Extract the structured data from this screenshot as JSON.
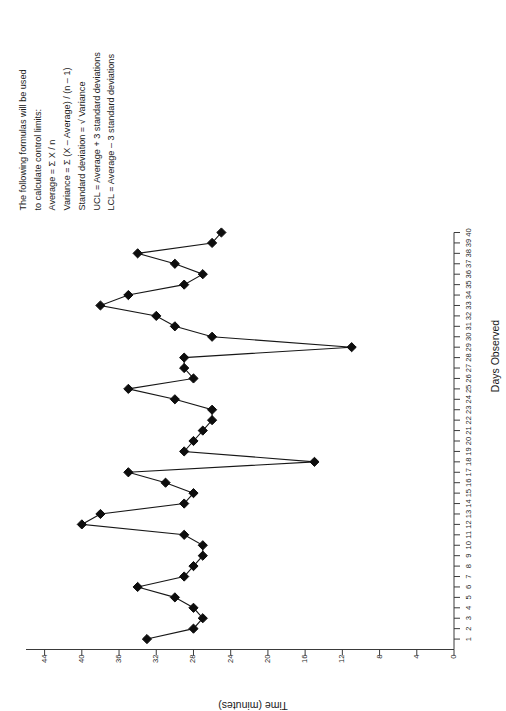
{
  "chart_data": {
    "type": "line",
    "title": "",
    "xlabel": "Days Observed",
    "ylabel": "Time (minutes)",
    "xlim": [
      0,
      40
    ],
    "ylim": [
      0,
      46
    ],
    "grid": false,
    "legend_position": "none",
    "marker": "diamond",
    "x_ticks": [
      1,
      2,
      3,
      4,
      5,
      6,
      7,
      8,
      9,
      10,
      11,
      12,
      13,
      14,
      15,
      16,
      17,
      18,
      19,
      20,
      21,
      22,
      23,
      24,
      25,
      26,
      27,
      28,
      29,
      30,
      31,
      32,
      33,
      34,
      35,
      36,
      37,
      38,
      39,
      40
    ],
    "y_ticks": [
      0,
      4,
      8,
      12,
      16,
      20,
      24,
      28,
      32,
      36,
      40,
      44
    ],
    "x": [
      1,
      2,
      3,
      4,
      5,
      6,
      7,
      8,
      9,
      10,
      11,
      12,
      13,
      14,
      15,
      16,
      17,
      18,
      19,
      20,
      21,
      22,
      23,
      24,
      25,
      26,
      27,
      28,
      29,
      30,
      31,
      32,
      33,
      34,
      35,
      36,
      37,
      38,
      39,
      40
    ],
    "values": [
      33,
      28,
      27,
      28,
      30,
      34,
      29,
      28,
      27,
      27,
      29,
      40,
      38,
      29,
      28,
      31,
      35,
      15,
      29,
      28,
      27,
      26,
      26,
      30,
      35,
      28,
      29,
      29,
      11,
      26,
      30,
      32,
      38,
      35,
      29,
      27,
      30,
      34,
      26,
      25
    ],
    "series": [
      {
        "name": "Time (minutes)",
        "values": [
          33,
          28,
          27,
          28,
          30,
          34,
          29,
          28,
          27,
          27,
          29,
          40,
          38,
          29,
          28,
          31,
          35,
          15,
          29,
          28,
          27,
          26,
          26,
          30,
          35,
          28,
          29,
          29,
          11,
          26,
          30,
          32,
          38,
          35,
          29,
          27,
          30,
          34,
          26,
          25
        ]
      }
    ]
  },
  "notes": {
    "lines": [
      "The following formulas will be used",
      "to calculate control limits:",
      "Average = Σ X / n",
      "Variance = Σ (X – Average) / (n – 1)",
      "Standard deviation = √ Variance",
      "UCL = Average + 3 standard deviations",
      "LCL = Average – 3 standard deviations"
    ],
    "line1": "The following formulas will be used",
    "line2": "to calculate control limits:",
    "line3": "Average = Σ X / n",
    "line4": "Variance = Σ (X – Average) / (n – 1)",
    "line5": "Standard deviation = √ Variance",
    "line6": "UCL = Average + 3 standard deviations",
    "line7": "LCL = Average – 3 standard deviations"
  }
}
